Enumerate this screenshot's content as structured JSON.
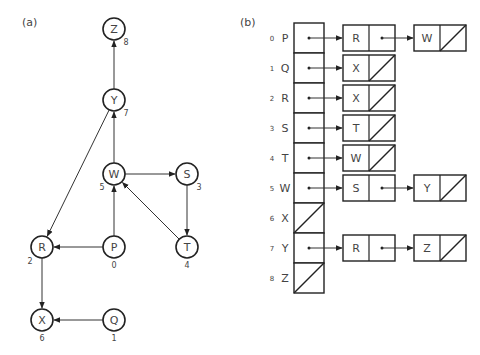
{
  "panel_a": {
    "label": "(a)",
    "nodes": [
      {
        "id": "Z",
        "index": "8",
        "cx": 114,
        "cy": 29,
        "ix": 126,
        "iy": 45
      },
      {
        "id": "Y",
        "index": "7",
        "cx": 114,
        "cy": 100,
        "ix": 126,
        "iy": 116
      },
      {
        "id": "W",
        "index": "5",
        "cx": 114,
        "cy": 174,
        "ix": 102,
        "iy": 190
      },
      {
        "id": "S",
        "index": "3",
        "cx": 187,
        "cy": 174,
        "ix": 199,
        "iy": 190
      },
      {
        "id": "R",
        "index": "2",
        "cx": 42,
        "cy": 247,
        "ix": 30,
        "iy": 264
      },
      {
        "id": "P",
        "index": "0",
        "cx": 114,
        "cy": 247,
        "ix": 114,
        "iy": 268
      },
      {
        "id": "T",
        "index": "4",
        "cx": 187,
        "cy": 247,
        "ix": 187,
        "iy": 268
      },
      {
        "id": "X",
        "index": "6",
        "cx": 42,
        "cy": 320,
        "ix": 42,
        "iy": 341
      },
      {
        "id": "Q",
        "index": "1",
        "cx": 114,
        "cy": 320,
        "ix": 114,
        "iy": 341
      }
    ],
    "edges": [
      {
        "from": "Y",
        "to": "Z"
      },
      {
        "from": "W",
        "to": "Y"
      },
      {
        "from": "W",
        "to": "S"
      },
      {
        "from": "S",
        "to": "T"
      },
      {
        "from": "T",
        "to": "W"
      },
      {
        "from": "P",
        "to": "W"
      },
      {
        "from": "P",
        "to": "R"
      },
      {
        "from": "Y",
        "to": "R"
      },
      {
        "from": "R",
        "to": "X"
      },
      {
        "from": "Q",
        "to": "X"
      }
    ]
  },
  "panel_b": {
    "label": "(b)",
    "rows": [
      {
        "index": "0",
        "vertex": "P",
        "list": [
          "R",
          "W"
        ]
      },
      {
        "index": "1",
        "vertex": "Q",
        "list": [
          "X"
        ]
      },
      {
        "index": "2",
        "vertex": "R",
        "list": [
          "X"
        ]
      },
      {
        "index": "3",
        "vertex": "S",
        "list": [
          "T"
        ]
      },
      {
        "index": "4",
        "vertex": "T",
        "list": [
          "W"
        ]
      },
      {
        "index": "5",
        "vertex": "W",
        "list": [
          "S",
          "Y"
        ]
      },
      {
        "index": "6",
        "vertex": "X",
        "list": []
      },
      {
        "index": "7",
        "vertex": "Y",
        "list": [
          "R",
          "Z"
        ]
      },
      {
        "index": "8",
        "vertex": "Z",
        "list": []
      }
    ]
  }
}
